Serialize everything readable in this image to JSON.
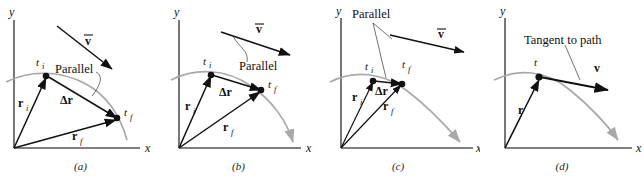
{
  "figure": {
    "width": 644,
    "height": 176,
    "background": "#ffffff",
    "colors": {
      "ink": "#111111",
      "path_curve": "#a8a8a8",
      "axis": "#555555",
      "vector": "#111111"
    }
  },
  "panels": [
    {
      "id": "a",
      "caption": "(a)",
      "axes": {
        "x_label": "x",
        "y_label": "y"
      },
      "labels": {
        "parallel": "Parallel",
        "avg_velocity": "v",
        "avg_velocity_overbar": true,
        "t_initial": "t",
        "t_initial_sub": "i",
        "t_final": "t",
        "t_final_sub": "f",
        "r_initial": "r",
        "r_initial_sub": "i",
        "r_final": "r",
        "r_final_sub": "f",
        "delta_r": "Δr"
      }
    },
    {
      "id": "b",
      "caption": "(b)",
      "axes": {
        "x_label": "x",
        "y_label": "y"
      },
      "labels": {
        "parallel": "Parallel",
        "avg_velocity": "v",
        "avg_velocity_overbar": true,
        "t_initial": "t",
        "t_initial_sub": "i",
        "t_final": "t",
        "t_final_sub": "f",
        "r_initial": "r",
        "r_initial_sub": "i",
        "r_final": "r",
        "r_final_sub": "f",
        "delta_r": "Δr"
      }
    },
    {
      "id": "c",
      "caption": "(c)",
      "axes": {
        "x_label": "x",
        "y_label": "y"
      },
      "labels": {
        "parallel": "Parallel",
        "avg_velocity": "v",
        "avg_velocity_overbar": true,
        "t_initial": "t",
        "t_initial_sub": "i",
        "t_final": "t",
        "t_final_sub": "f",
        "r_initial": "r",
        "r_initial_sub": "i",
        "r_final": "r",
        "r_final_sub": "f",
        "delta_r": "Δr"
      }
    },
    {
      "id": "d",
      "caption": "(d)",
      "axes": {
        "x_label": "x",
        "y_label": "y"
      },
      "labels": {
        "tangent": "Tangent to path",
        "velocity": "v",
        "t_label": "t",
        "r_label": "r"
      }
    }
  ]
}
